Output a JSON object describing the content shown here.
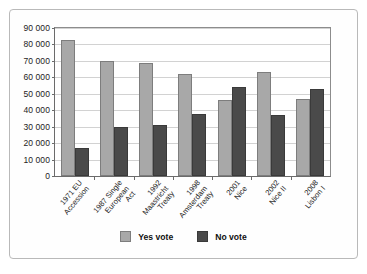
{
  "chart_data": {
    "type": "bar",
    "title": "",
    "subtitle": "",
    "xlabel": "",
    "ylabel": "",
    "ylim": [
      0,
      90000
    ],
    "ytick_step": 10000,
    "yticks": [
      "90 000",
      "80 000",
      "70 000",
      "60 000",
      "50 000",
      "40 000",
      "30 000",
      "20 000",
      "10 000",
      "0"
    ],
    "ytick_values": [
      90000,
      80000,
      70000,
      60000,
      50000,
      40000,
      30000,
      20000,
      10000,
      0
    ],
    "grid": true,
    "legend_position": "bottom-center",
    "categories": [
      "1971 EU Accession",
      "1987 Single European Act",
      "1992 Maastricht Treaty",
      "1998 Amsterdam Treaty",
      "2001 Nice",
      "2002 Nice II",
      "2008 Lisbon I"
    ],
    "category_lines": [
      [
        "1971 EU",
        "Accession"
      ],
      [
        "1987 Single",
        "European",
        "Act"
      ],
      [
        "1992",
        "Maastricht",
        "Treaty"
      ],
      [
        "1998",
        "Amsterdam",
        "Treaty"
      ],
      [
        "2001",
        "Nice"
      ],
      [
        "2002",
        "Nice II"
      ],
      [
        "2008",
        "Lisbon I"
      ]
    ],
    "series": [
      {
        "name": "Yes vote",
        "color": "#a8a8a8",
        "values": [
          83000,
          70000,
          69000,
          62000,
          46000,
          63000,
          47000
        ]
      },
      {
        "name": "No vote",
        "color": "#4a4a4a",
        "values": [
          17000,
          30000,
          31000,
          38000,
          54000,
          37000,
          53000
        ]
      }
    ]
  },
  "legend": {
    "items": [
      {
        "label": "Yes vote",
        "color": "#a8a8a8"
      },
      {
        "label": "No vote",
        "color": "#4a4a4a"
      }
    ]
  }
}
